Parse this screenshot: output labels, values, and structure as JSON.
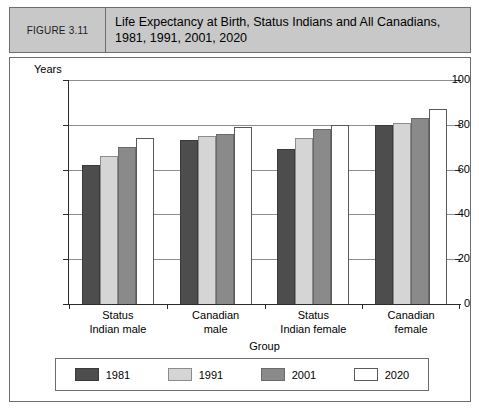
{
  "header": {
    "figure_tag": "FIGURE 3.11",
    "title": "Life Expectancy at Birth, Status Indians and All Canadians, 1981, 1991, 2001, 2020"
  },
  "chart_data": {
    "type": "bar",
    "title": "Life Expectancy at Birth, Status Indians and All Canadians, 1981, 1991, 2001, 2020",
    "xlabel": "Group",
    "ylabel": "Years",
    "ylim": [
      0,
      100
    ],
    "yticks": [
      0,
      20,
      40,
      60,
      80,
      100
    ],
    "ytick_labels": [
      "0",
      "20",
      "40",
      "60",
      "80",
      "100"
    ],
    "grid": true,
    "legend_position": "bottom",
    "categories": [
      "Status Indian male",
      "Canadian male",
      "Status Indian female",
      "Canadian female"
    ],
    "category_lines": [
      [
        "Status",
        "Indian male"
      ],
      [
        "Canadian",
        "male"
      ],
      [
        "Status",
        "Indian female"
      ],
      [
        "Canadian",
        "female"
      ]
    ],
    "series": [
      {
        "name": "1981",
        "color": "#4d4d4d",
        "values": [
          62,
          73,
          69,
          80
        ]
      },
      {
        "name": "1991",
        "color": "#d5d5d5",
        "values": [
          66,
          75,
          74,
          81
        ]
      },
      {
        "name": "2001",
        "color": "#8a8a8a",
        "values": [
          70,
          76,
          78,
          83
        ]
      },
      {
        "name": "2020",
        "color": "#ffffff",
        "values": [
          74,
          79,
          80,
          87
        ]
      }
    ]
  },
  "colors": {
    "header_band": "#c8c8c8",
    "frame_border": "#6d6d6d",
    "axis": "#2b2b2b",
    "gridline": "#8d8d8d"
  }
}
